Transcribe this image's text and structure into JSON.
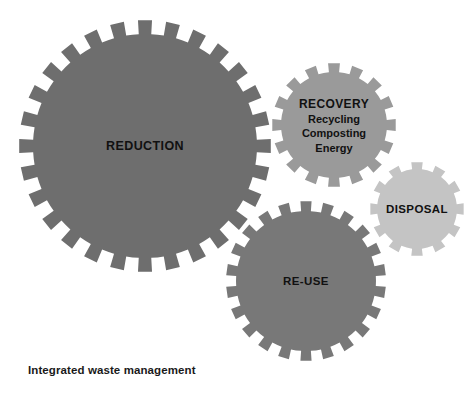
{
  "figure": {
    "caption": "Integrated waste management",
    "background_color": "#ffffff",
    "text_color": "#111111",
    "width": 475,
    "height": 397
  },
  "chart_data": {
    "type": "diagram",
    "diagram_style": "interlocking-gears",
    "title": "Integrated waste management",
    "gears": [
      {
        "id": "reduction",
        "label": "REDUCTION",
        "sublabels": [],
        "rank": 1,
        "cx": 145,
        "cy": 146,
        "outer_radius": 126,
        "body_radius": 112,
        "teeth": 28,
        "tooth_width_deg": 6.4,
        "fill": "#6e6e6e",
        "label_x": 145,
        "label_y": 146
      },
      {
        "id": "recovery",
        "label": "RECOVERY",
        "sublabels": [
          "Recycling",
          "Composting",
          "Energy"
        ],
        "rank": 3,
        "cx": 334,
        "cy": 125,
        "outer_radius": 62,
        "body_radius": 53,
        "teeth": 16,
        "tooth_width_deg": 11,
        "fill": "#9a9a9a",
        "label_x": 334,
        "label_y": 126
      },
      {
        "id": "reuse",
        "label": "RE-USE",
        "sublabels": [],
        "rank": 2,
        "cx": 306,
        "cy": 281,
        "outer_radius": 80,
        "body_radius": 70,
        "teeth": 22,
        "tooth_width_deg": 8,
        "fill": "#787878",
        "label_x": 306,
        "label_y": 281
      },
      {
        "id": "disposal",
        "label": "DISPOSAL",
        "sublabels": [],
        "rank": 4,
        "cx": 417,
        "cy": 209,
        "outer_radius": 47,
        "body_radius": 40,
        "teeth": 12,
        "tooth_width_deg": 14,
        "fill": "#c4c4c4",
        "label_x": 417,
        "label_y": 209
      }
    ],
    "legend": [],
    "colors": {
      "reduction": "#6e6e6e",
      "reuse": "#787878",
      "recovery": "#9a9a9a",
      "disposal": "#c4c4c4",
      "background": "#ffffff",
      "text": "#111111"
    }
  }
}
